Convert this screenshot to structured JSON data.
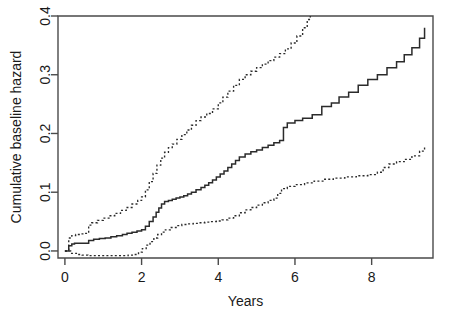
{
  "chart_data": {
    "type": "line",
    "title": "",
    "xlabel": "Years",
    "ylabel": "Cumulative baseline hazard",
    "xlim": [
      -0.18,
      9.6
    ],
    "ylim": [
      -0.012,
      0.4
    ],
    "xticks": [
      0,
      2,
      4,
      6,
      8
    ],
    "xtick_labels": [
      "0",
      "2",
      "4",
      "6",
      "8"
    ],
    "yticks": [
      0.0,
      0.1,
      0.2,
      0.3,
      0.4
    ],
    "ytick_labels": [
      "0.0",
      "0.1",
      "0.2",
      "0.3",
      "0.4"
    ],
    "grid": false,
    "legend": "none",
    "frame": "box",
    "note": "Cox model cumulative baseline hazard step function with pointwise confidence band (dotted upper and lower limits). Upper limit is clipped at the top of the panel beyond about 6.4 years.",
    "series": [
      {
        "name": "Cumulative baseline hazard",
        "style": "solid",
        "step": "post",
        "x": [
          0.0,
          0.1,
          0.18,
          0.25,
          0.32,
          0.4,
          0.55,
          0.62,
          0.75,
          0.9,
          1.05,
          1.2,
          1.35,
          1.5,
          1.62,
          1.75,
          1.88,
          2.0,
          2.1,
          2.2,
          2.3,
          2.38,
          2.45,
          2.52,
          2.6,
          2.7,
          2.8,
          2.9,
          3.0,
          3.1,
          3.2,
          3.3,
          3.42,
          3.55,
          3.65,
          3.75,
          3.85,
          3.95,
          4.05,
          4.15,
          4.25,
          4.35,
          4.45,
          4.55,
          4.7,
          4.85,
          5.0,
          5.15,
          5.3,
          5.45,
          5.6,
          5.7,
          5.8,
          6.0,
          6.2,
          6.45,
          6.7,
          6.95,
          7.15,
          7.4,
          7.65,
          7.9,
          8.15,
          8.4,
          8.65,
          8.85,
          9.05,
          9.25,
          9.38
        ],
        "y": [
          0.0,
          0.009,
          0.012,
          0.013,
          0.013,
          0.013,
          0.013,
          0.018,
          0.02,
          0.021,
          0.022,
          0.024,
          0.026,
          0.028,
          0.03,
          0.032,
          0.034,
          0.036,
          0.042,
          0.05,
          0.058,
          0.066,
          0.073,
          0.08,
          0.084,
          0.086,
          0.088,
          0.09,
          0.092,
          0.094,
          0.097,
          0.1,
          0.104,
          0.108,
          0.112,
          0.116,
          0.121,
          0.126,
          0.131,
          0.136,
          0.142,
          0.148,
          0.154,
          0.16,
          0.165,
          0.169,
          0.172,
          0.176,
          0.18,
          0.184,
          0.188,
          0.21,
          0.218,
          0.222,
          0.226,
          0.232,
          0.246,
          0.252,
          0.262,
          0.27,
          0.282,
          0.292,
          0.3,
          0.312,
          0.322,
          0.334,
          0.346,
          0.362,
          0.38
        ]
      },
      {
        "name": "Upper confidence limit",
        "style": "dotted",
        "step": "post",
        "x": [
          0.0,
          0.1,
          0.18,
          0.28,
          0.4,
          0.5,
          0.58,
          0.62,
          0.7,
          0.85,
          1.0,
          1.15,
          1.3,
          1.45,
          1.6,
          1.75,
          1.9,
          2.0,
          2.1,
          2.2,
          2.3,
          2.4,
          2.5,
          2.6,
          2.7,
          2.8,
          2.92,
          3.05,
          3.18,
          3.3,
          3.42,
          3.55,
          3.7,
          3.85,
          4.0,
          4.12,
          4.25,
          4.4,
          4.55,
          4.7,
          4.85,
          5.0,
          5.15,
          5.3,
          5.45,
          5.6,
          5.75,
          5.9,
          6.05,
          6.2,
          6.32,
          6.4
        ],
        "y": [
          0.0,
          0.022,
          0.026,
          0.028,
          0.029,
          0.03,
          0.03,
          0.044,
          0.048,
          0.052,
          0.056,
          0.06,
          0.064,
          0.069,
          0.074,
          0.08,
          0.086,
          0.092,
          0.104,
          0.118,
          0.132,
          0.146,
          0.158,
          0.168,
          0.176,
          0.182,
          0.19,
          0.198,
          0.206,
          0.214,
          0.222,
          0.228,
          0.234,
          0.242,
          0.252,
          0.262,
          0.272,
          0.282,
          0.292,
          0.3,
          0.306,
          0.312,
          0.318,
          0.324,
          0.33,
          0.336,
          0.344,
          0.354,
          0.366,
          0.38,
          0.394,
          0.4
        ]
      },
      {
        "name": "Lower confidence limit",
        "style": "dotted",
        "step": "post",
        "x": [
          0.0,
          0.15,
          0.3,
          0.45,
          0.6,
          0.75,
          0.9,
          1.05,
          1.2,
          1.35,
          1.5,
          1.65,
          1.8,
          1.92,
          2.02,
          2.12,
          2.22,
          2.32,
          2.42,
          2.52,
          2.62,
          2.75,
          2.9,
          3.05,
          3.2,
          3.35,
          3.5,
          3.65,
          3.8,
          3.95,
          4.1,
          4.25,
          4.4,
          4.55,
          4.7,
          4.85,
          5.0,
          5.15,
          5.3,
          5.45,
          5.55,
          5.65,
          5.8,
          6.0,
          6.25,
          6.5,
          6.75,
          7.0,
          7.3,
          7.6,
          7.9,
          8.15,
          8.3,
          8.45,
          8.65,
          8.85,
          9.05,
          9.25,
          9.38
        ],
        "y": [
          0.0,
          -0.004,
          -0.006,
          -0.007,
          -0.008,
          -0.008,
          -0.008,
          -0.008,
          -0.008,
          -0.008,
          -0.008,
          -0.007,
          -0.006,
          -0.002,
          0.004,
          0.01,
          0.016,
          0.022,
          0.028,
          0.032,
          0.036,
          0.04,
          0.043,
          0.045,
          0.046,
          0.047,
          0.048,
          0.049,
          0.05,
          0.051,
          0.053,
          0.056,
          0.06,
          0.065,
          0.07,
          0.074,
          0.078,
          0.082,
          0.086,
          0.09,
          0.098,
          0.106,
          0.11,
          0.113,
          0.116,
          0.119,
          0.122,
          0.124,
          0.126,
          0.128,
          0.13,
          0.134,
          0.142,
          0.148,
          0.152,
          0.156,
          0.162,
          0.17,
          0.176
        ]
      }
    ]
  }
}
